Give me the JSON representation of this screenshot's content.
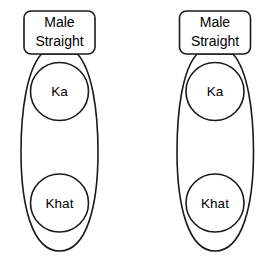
{
  "diagram": {
    "type": "pedigree-group-diagram",
    "background_color": "#ffffff",
    "stroke_color": "#1a1a1a",
    "fill_color": "#ffffff",
    "groups": [
      {
        "id": "group-left",
        "label_box": {
          "line1": "Male",
          "line2": "Straight"
        },
        "members": [
          {
            "id": "left-node-ka",
            "label": "Ka"
          },
          {
            "id": "left-node-khat",
            "label": "Khat"
          }
        ]
      },
      {
        "id": "group-right",
        "label_box": {
          "line1": "Male",
          "line2": "Straight"
        },
        "members": [
          {
            "id": "right-node-ka",
            "label": "Ka"
          },
          {
            "id": "right-node-khat",
            "label": "Khat"
          }
        ]
      }
    ]
  }
}
